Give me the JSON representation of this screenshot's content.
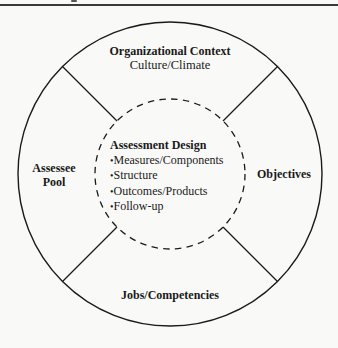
{
  "diagram": {
    "outer_ring": {
      "top": {
        "title": "Organizational Context",
        "subtitle": "Culture/Climate"
      },
      "left": {
        "title_line1": "Assessee",
        "title_line2": "Pool"
      },
      "right": {
        "title": "Objectives"
      },
      "bottom": {
        "title": "Jobs/Competencies"
      }
    },
    "center": {
      "title": "Assessment Design",
      "items": [
        "Measures/Components",
        "Structure",
        "Outcomes/Products",
        "Follow-up"
      ]
    },
    "colors": {
      "stroke": "#1a1a1a",
      "background": "#f9f9f7"
    }
  }
}
